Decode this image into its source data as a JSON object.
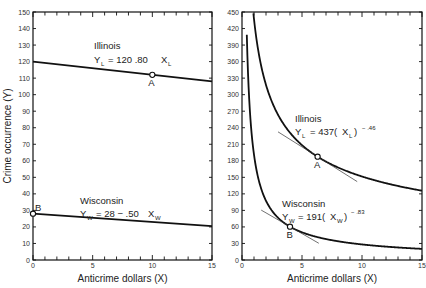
{
  "chart_data": [
    {
      "type": "line",
      "panel": "left",
      "title": "",
      "xlabel": "Anticrime dollars (X)",
      "ylabel": "Crime occurrence (Y)",
      "xlim": [
        0,
        15
      ],
      "ylim": [
        0,
        150
      ],
      "x_ticks": [
        0,
        5,
        10,
        15
      ],
      "y_ticks": [
        0,
        10,
        20,
        30,
        40,
        50,
        60,
        70,
        80,
        90,
        100,
        110,
        120,
        130,
        140,
        150
      ],
      "grid": false,
      "series": [
        {
          "name": "Illinois",
          "equation": "Y_L = 120 - .80 X_L",
          "x": [
            0,
            15
          ],
          "values": [
            120,
            108
          ]
        },
        {
          "name": "Wisconsin",
          "equation": "Y_W = 28 - .50 X_W",
          "x": [
            0,
            15
          ],
          "values": [
            28,
            20.5
          ]
        }
      ],
      "annotations": [
        {
          "label": "A",
          "x": 10,
          "y": 112
        },
        {
          "label": "B",
          "x": 0,
          "y": 28
        }
      ]
    },
    {
      "type": "line",
      "panel": "right",
      "title": "",
      "xlabel": "Anticrime dollars (X)",
      "ylabel": "",
      "xlim": [
        0,
        15
      ],
      "ylim": [
        0,
        450
      ],
      "x_ticks": [
        0,
        5,
        10,
        15
      ],
      "y_ticks": [
        0,
        30,
        60,
        90,
        120,
        150,
        180,
        210,
        240,
        270,
        300,
        330,
        360,
        390,
        420,
        450
      ],
      "grid": false,
      "series": [
        {
          "name": "Illinois",
          "equation": "Y_L = 437(X_L)^-.46",
          "coef": 437,
          "exponent": -0.46
        },
        {
          "name": "Wisconsin",
          "equation": "Y_W = 191(X_W)^-.83",
          "coef": 191,
          "exponent": -0.83
        }
      ],
      "annotations": [
        {
          "label": "A",
          "x": 6.3,
          "y": 187,
          "tangent": true
        },
        {
          "label": "B",
          "x": 4,
          "y": 60,
          "tangent": true
        }
      ]
    }
  ],
  "labels": {
    "ylabel": "Crime occurrence (Y)",
    "xlabel": "Anticrime dollars (X)",
    "left_illinois_name": "Illinois",
    "left_illinois_eq_main": "= 120   .80",
    "left_wisconsin_name": "Wisconsin",
    "left_wisconsin_eq_main": "= 28 − .50",
    "right_illinois_name": "Illinois",
    "right_illinois_eq_main": "= 437(",
    "right_illinois_exp": "− .46",
    "right_wisconsin_name": "Wisconsin",
    "right_wisconsin_eq_main": "= 191(",
    "right_wisconsin_exp": "− .83",
    "point_a": "A",
    "point_b": "B",
    "var_y": "Y",
    "var_x": "X",
    "sub_l": "L",
    "sub_w": "W"
  }
}
